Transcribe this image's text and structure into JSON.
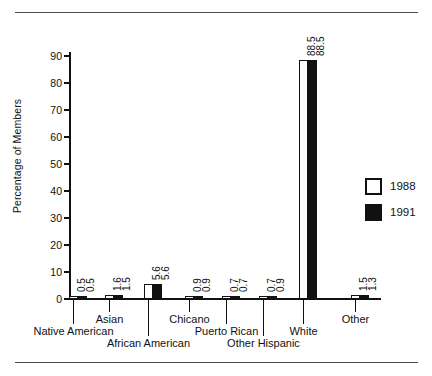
{
  "chart_data": {
    "type": "bar",
    "title": "",
    "xlabel": "",
    "ylabel": "Percentage of Members",
    "ylim": [
      0,
      95
    ],
    "yticks": [
      0,
      10,
      20,
      30,
      40,
      50,
      60,
      70,
      80,
      90
    ],
    "ytick_labels": [
      "0",
      "10",
      "20",
      "30",
      "40",
      "50",
      "60",
      "70",
      "80",
      "90"
    ],
    "grid": false,
    "legend_position": "right",
    "categories": [
      "Native American",
      "Asian",
      "African American",
      "Chicano",
      "Puerto Rican",
      "Other Hispanic",
      "White",
      "Other"
    ],
    "series": [
      {
        "name": "1988",
        "color": "#ffffff",
        "values": [
          0.5,
          1.6,
          5.6,
          0.9,
          0.7,
          0.7,
          88.5,
          1.5
        ],
        "value_labels": [
          "0.5",
          "1.6",
          "5.6",
          "0.9",
          "0.7",
          "0.7",
          "88.5",
          "1.5"
        ]
      },
      {
        "name": "1991",
        "color": "#111111",
        "values": [
          0.5,
          1.5,
          5.6,
          0.9,
          0.7,
          0.9,
          88.5,
          1.3
        ],
        "value_labels": [
          "0.5",
          "1.5",
          "5.6",
          "0.9",
          "0.7",
          "0.9",
          "88.5",
          "1.3"
        ]
      }
    ]
  },
  "legend": {
    "entries": [
      {
        "label": "1988",
        "swatch": "open-square-swatch"
      },
      {
        "label": "1991",
        "swatch": "filled-square-swatch"
      }
    ]
  },
  "colors": {
    "series_1988": "#ffffff",
    "series_1991": "#111111",
    "axis": "#111111",
    "rule": "#4a4a4a",
    "background": "#ffffff"
  }
}
